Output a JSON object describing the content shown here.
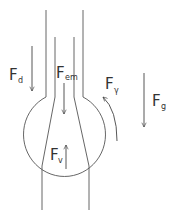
{
  "diagram": {
    "stroke_color": "#444444",
    "background": "#ffffff",
    "forces": [
      {
        "id": "drag",
        "main": "F",
        "sub": "d",
        "direction": "down"
      },
      {
        "id": "electromagnetic",
        "main": "F",
        "sub": "em",
        "direction": "down"
      },
      {
        "id": "surface-tension",
        "main": "F",
        "sub": "γ",
        "direction": "counter-clockwise curved up"
      },
      {
        "id": "gravity",
        "main": "F",
        "sub": "g",
        "direction": "down"
      },
      {
        "id": "buoyancy",
        "main": "F",
        "sub": "v",
        "direction": "up"
      }
    ]
  }
}
